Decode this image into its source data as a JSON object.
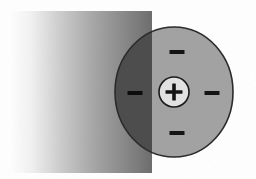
{
  "figure": {
    "background_color": "#ffffff",
    "width": 256,
    "height": 179
  },
  "gradient_field": {
    "name": "field-gradient-rectangle",
    "x": 11,
    "y": 11,
    "width": 141,
    "height": 162,
    "direction": "left-to-right",
    "from_color": "#fdfdfd",
    "mid_color": "#c9c9c9",
    "to_color": "#6f6f6f",
    "stops": [
      {
        "offset": 0,
        "color": "#fefefe"
      },
      {
        "offset": 14,
        "color": "#f2f2f2"
      },
      {
        "offset": 34,
        "color": "#cfcfcf"
      },
      {
        "offset": 58,
        "color": "#a8a8a8"
      },
      {
        "offset": 80,
        "color": "#8a8a8a"
      },
      {
        "offset": 100,
        "color": "#6e6e6e"
      }
    ]
  },
  "atom": {
    "name": "atom-circle",
    "cx": 174,
    "cy": 92,
    "rx": 59,
    "ry": 65,
    "fill_color": "#a3a3a3",
    "overlap_fill_color": "#4d4d4d",
    "stroke_color": "#2b2b2b",
    "stroke_width": 1.6
  },
  "nucleus": {
    "name": "nucleus",
    "cx": 174,
    "cy": 92,
    "r": 15,
    "fill_color": "#e3e3e3",
    "stroke_color": "#1a1a1a",
    "stroke_width": 1.6,
    "charge_symbol": "+",
    "charge_label": "positive-nucleus",
    "symbol_color": "#141414"
  },
  "electrons": [
    {
      "name": "electron-top",
      "charge_symbol": "−",
      "position": "top",
      "cx": 177,
      "cy": 52,
      "bar_width": 15,
      "bar_height": 4,
      "color": "#141414"
    },
    {
      "name": "electron-left",
      "charge_symbol": "−",
      "position": "left",
      "cx": 135,
      "cy": 93,
      "bar_width": 15,
      "bar_height": 4,
      "color": "#0d0d0d"
    },
    {
      "name": "electron-right",
      "charge_symbol": "−",
      "position": "right",
      "cx": 212,
      "cy": 93,
      "bar_width": 15,
      "bar_height": 4,
      "color": "#141414"
    },
    {
      "name": "electron-bottom",
      "charge_symbol": "−",
      "position": "bottom",
      "cx": 177,
      "cy": 133,
      "bar_width": 15,
      "bar_height": 4,
      "color": "#141414"
    }
  ]
}
